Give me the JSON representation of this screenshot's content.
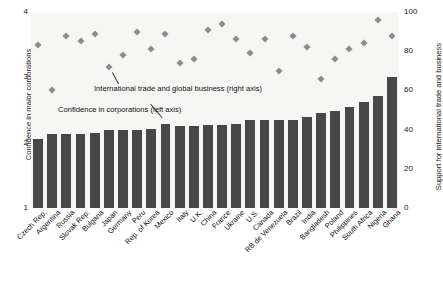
{
  "chart_data": {
    "type": "bar",
    "title": "",
    "subtitle": "",
    "ylabel": "Confidence in major corporations",
    "y2label": "Support for international trade and business",
    "xlabel": "",
    "ylim": [
      1,
      4
    ],
    "y2lim": [
      0,
      100
    ],
    "yticks": [
      "4",
      "3",
      "2",
      "1"
    ],
    "y2ticks": [
      "100",
      "80",
      "60",
      "40",
      "20",
      "0"
    ],
    "grid": false,
    "legend_position": "inline-annotation",
    "annotations": [
      "International trade and global business (right axis)",
      "Confidence in corporations (left axis)"
    ],
    "categories": [
      "Czech Rep.",
      "Argentina",
      "Russia",
      "Slovak Rep.",
      "Bulgaria",
      "Japan",
      "Germany",
      "Peru",
      "Rep. of Korea",
      "Mexico",
      "Italy",
      "U.K.",
      "China",
      "France",
      "Ukraine",
      "U.S.",
      "Canada",
      "RB de Venezuela",
      "Brazil",
      "India",
      "Bangladesh",
      "Poland",
      "Philippines",
      "South Africa",
      "Nigeria",
      "Ghana"
    ],
    "series": [
      {
        "name": "Confidence in corporations (left axis)",
        "axis": "left",
        "type": "bar",
        "color": "#474747",
        "values": [
          2.05,
          2.14,
          2.13,
          2.13,
          2.15,
          2.2,
          2.2,
          2.2,
          2.21,
          2.28,
          2.26,
          2.26,
          2.27,
          2.27,
          2.28,
          2.34,
          2.34,
          2.35,
          2.34,
          2.4,
          2.45,
          2.48,
          2.55,
          2.62,
          2.72,
          3.0
        ]
      },
      {
        "name": "International trade and global business (right axis)",
        "axis": "right",
        "type": "scatter",
        "color": "#8c8c8c",
        "values": [
          83,
          60,
          88,
          85,
          89,
          72,
          78,
          90,
          81,
          89,
          74,
          76,
          91,
          94,
          86,
          79,
          86,
          70,
          88,
          82,
          66,
          76,
          81,
          84,
          96,
          88
        ]
      }
    ]
  }
}
